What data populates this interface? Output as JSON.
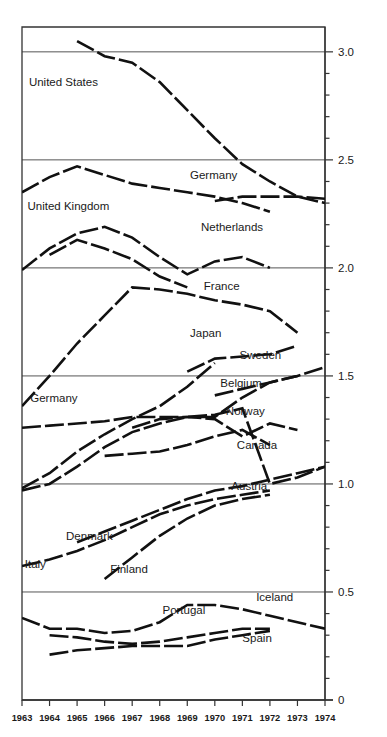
{
  "chart_data": {
    "type": "line",
    "title": "",
    "subtitle": "",
    "xlabel": "",
    "ylabel": "",
    "x": [
      1963,
      1964,
      1965,
      1966,
      1967,
      1968,
      1969,
      1970,
      1971,
      1972,
      1973,
      1974
    ],
    "xlim": [
      1963,
      1974
    ],
    "ylim": [
      0,
      3.1
    ],
    "ytick_labels": [
      "0",
      "0.5",
      "1.0",
      "1.5",
      "2.0",
      "2.5",
      "3.0"
    ],
    "ytick_values": [
      0,
      0.5,
      1.0,
      1.5,
      2.0,
      2.5,
      3.0
    ],
    "yminor_step": 0.1,
    "xtick_labels": [
      "1963",
      "1964",
      "1965",
      "1966",
      "1967",
      "1968",
      "1969",
      "1970",
      "1971",
      "1972",
      "1973",
      "1974"
    ],
    "grid": "horizontal-major-only",
    "legend": "inline-labels",
    "line_style": "dashed-thick-black",
    "line_color": "#111111",
    "grid_color": "#555555",
    "axis_color": "#333333",
    "series": [
      {
        "name": "United States",
        "label": "United States",
        "label_x": 1963.25,
        "label_y": 2.84,
        "x": [
          1965,
          1966,
          1967,
          1968,
          1969,
          1970,
          1971,
          1972,
          1973,
          1974
        ],
        "values": [
          3.05,
          2.98,
          2.95,
          2.86,
          2.73,
          2.6,
          2.48,
          2.4,
          2.33,
          2.3
        ]
      },
      {
        "name": "United Kingdom",
        "label": "United Kingdom",
        "label_x": 1963.2,
        "label_y": 2.27,
        "x": [
          1963,
          1964,
          1965,
          1966,
          1967,
          1968,
          1969,
          1970,
          1971,
          1972
        ],
        "values": [
          2.35,
          2.42,
          2.47,
          2.43,
          2.39,
          2.37,
          2.35,
          2.33,
          2.3,
          2.26
        ]
      },
      {
        "name": "Germany (upper)",
        "label": "Germany",
        "label_x": 1969.1,
        "label_y": 2.41,
        "x": [
          1970,
          1971,
          1972,
          1973,
          1974
        ],
        "values": [
          2.31,
          2.33,
          2.33,
          2.33,
          2.32
        ]
      },
      {
        "name": "Netherlands",
        "label": "Netherlands",
        "label_x": 1969.5,
        "label_y": 2.17,
        "x": [
          1963,
          1964,
          1965,
          1966,
          1967,
          1968,
          1969,
          1970,
          1971,
          1972
        ],
        "values": [
          1.99,
          2.09,
          2.16,
          2.19,
          2.14,
          2.05,
          1.97,
          2.03,
          2.05,
          2.0
        ]
      },
      {
        "name": "Netherlands (alt)",
        "label": "",
        "label_x": 0,
        "label_y": 0,
        "x": [
          1964,
          1965,
          1966,
          1967,
          1968,
          1969
        ],
        "values": [
          2.06,
          2.13,
          2.09,
          2.04,
          1.96,
          1.91
        ]
      },
      {
        "name": "France",
        "label": "France",
        "label_x": 1969.6,
        "label_y": 1.9,
        "x": [
          1963,
          1964,
          1965,
          1966,
          1967,
          1968,
          1969,
          1970,
          1971,
          1972,
          1973
        ],
        "values": [
          1.36,
          1.5,
          1.65,
          1.78,
          1.91,
          1.9,
          1.88,
          1.85,
          1.83,
          1.8,
          1.7
        ]
      },
      {
        "name": "Japan",
        "label": "Japan",
        "label_x": 1969.1,
        "label_y": 1.68,
        "x": [
          1969,
          1970,
          1971,
          1972,
          1973
        ],
        "values": [
          1.52,
          1.58,
          1.59,
          1.6,
          1.64
        ]
      },
      {
        "name": "Sweden",
        "label": "Sweden",
        "label_x": 1970.9,
        "label_y": 1.58,
        "x": [
          1970,
          1971,
          1972,
          1973,
          1974
        ],
        "values": [
          1.41,
          1.44,
          1.47,
          1.5,
          1.54
        ]
      },
      {
        "name": "Germany (lower)",
        "label": "Germany",
        "label_x": 1963.3,
        "label_y": 1.38,
        "x": [
          1963,
          1964,
          1965,
          1966,
          1967,
          1968,
          1969,
          1970
        ],
        "values": [
          0.98,
          1.05,
          1.15,
          1.23,
          1.3,
          1.36,
          1.45,
          1.56
        ]
      },
      {
        "name": "Belgium",
        "label": "Belgium",
        "label_x": 1970.2,
        "label_y": 1.45,
        "x": [
          1967,
          1968,
          1969,
          1970,
          1971,
          1972,
          1973
        ],
        "values": [
          1.26,
          1.3,
          1.31,
          1.31,
          1.4,
          1.47,
          1.5
        ]
      },
      {
        "name": "Norway",
        "label": "Norway",
        "label_x": 1970.4,
        "label_y": 1.32,
        "x": [
          1963,
          1964,
          1965,
          1966,
          1967,
          1968,
          1969,
          1970,
          1971,
          1972,
          1973
        ],
        "values": [
          1.26,
          1.27,
          1.28,
          1.29,
          1.31,
          1.31,
          1.31,
          1.3,
          1.22,
          1.28,
          1.25
        ]
      },
      {
        "name": "Canada",
        "label": "Canada",
        "label_x": 1970.8,
        "label_y": 1.16,
        "x": [
          1966,
          1967,
          1968,
          1969,
          1970,
          1971,
          1972
        ],
        "values": [
          1.13,
          1.14,
          1.15,
          1.18,
          1.22,
          1.25,
          1.18
        ]
      },
      {
        "name": "Austria",
        "label": "Austria",
        "label_x": 1970.6,
        "label_y": 0.97,
        "x": [
          1963,
          1964,
          1965,
          1966,
          1967,
          1968,
          1969,
          1970,
          1971,
          1972,
          1973,
          1974
        ],
        "values": [
          0.97,
          1.0,
          1.08,
          1.17,
          1.24,
          1.28,
          1.31,
          1.32,
          1.35,
          1.0,
          1.03,
          1.08
        ]
      },
      {
        "name": "Denmark",
        "label": "Denmark",
        "label_x": 1964.6,
        "label_y": 0.74,
        "x": [
          1965,
          1966,
          1967,
          1968,
          1969,
          1970,
          1971,
          1972,
          1973,
          1974
        ],
        "values": [
          0.73,
          0.78,
          0.83,
          0.88,
          0.93,
          0.97,
          0.99,
          1.02,
          1.05,
          1.08
        ]
      },
      {
        "name": "Italy",
        "label": "Italy",
        "label_x": 1963.1,
        "label_y": 0.61,
        "x": [
          1963,
          1964,
          1965,
          1966,
          1967,
          1968,
          1969,
          1970,
          1971,
          1972
        ],
        "values": [
          0.62,
          0.65,
          0.69,
          0.74,
          0.8,
          0.86,
          0.9,
          0.93,
          0.95,
          0.97
        ]
      },
      {
        "name": "Finland",
        "label": "Finland",
        "label_x": 1966.2,
        "label_y": 0.59,
        "x": [
          1966,
          1967,
          1968,
          1969,
          1970,
          1971,
          1972
        ],
        "values": [
          0.56,
          0.66,
          0.76,
          0.84,
          0.9,
          0.93,
          0.95
        ]
      },
      {
        "name": "Iceland",
        "label": "Iceland",
        "label_x": 1971.5,
        "label_y": 0.46,
        "x": [
          1963,
          1964,
          1965,
          1966,
          1967,
          1968,
          1969,
          1970,
          1971,
          1972,
          1973,
          1974
        ],
        "values": [
          0.38,
          0.33,
          0.33,
          0.31,
          0.32,
          0.36,
          0.44,
          0.44,
          0.42,
          0.39,
          0.36,
          0.33
        ]
      },
      {
        "name": "Portugal",
        "label": "Portugal",
        "label_x": 1968.1,
        "label_y": 0.4,
        "x": [
          1964,
          1965,
          1966,
          1967,
          1968,
          1969,
          1970,
          1971,
          1972
        ],
        "values": [
          0.3,
          0.29,
          0.27,
          0.26,
          0.27,
          0.29,
          0.31,
          0.33,
          0.33
        ]
      },
      {
        "name": "Spain",
        "label": "Spain",
        "label_x": 1971.0,
        "label_y": 0.27,
        "x": [
          1964,
          1965,
          1966,
          1967,
          1968,
          1969,
          1970,
          1971,
          1972
        ],
        "values": [
          0.21,
          0.23,
          0.24,
          0.25,
          0.25,
          0.25,
          0.28,
          0.3,
          0.32
        ]
      }
    ]
  }
}
